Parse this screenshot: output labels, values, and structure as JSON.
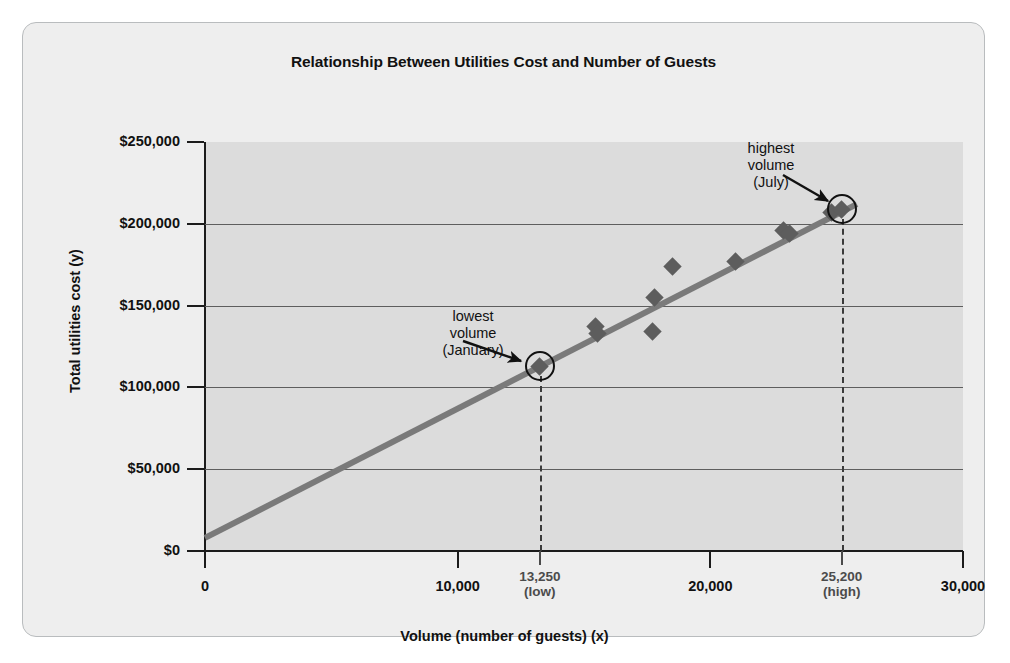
{
  "figure": {
    "title": "Relationship Between Utilities Cost and Number of Guests",
    "background_color": "#eeeeee",
    "plot_band_color": "#dcdcdc",
    "border_color": "#b9bcbe"
  },
  "chart_data": {
    "type": "scatter",
    "title": "Relationship Between Utilities Cost and Number of Guests",
    "xlabel": "Volume (number of guests) (x)",
    "ylabel": "Total utilities cost (y)",
    "xlim": [
      0,
      30000
    ],
    "ylim": [
      0,
      250000
    ],
    "grid": true,
    "legend": "none",
    "x_ticks": [
      {
        "value": 0,
        "label": "0",
        "sub": "",
        "special": false
      },
      {
        "value": 10000,
        "label": "10,000",
        "sub": "",
        "special": false
      },
      {
        "value": 13250,
        "label": "13,250",
        "sub": "(low)",
        "special": true
      },
      {
        "value": 20000,
        "label": "20,000",
        "sub": "",
        "special": false
      },
      {
        "value": 25200,
        "label": "25,200",
        "sub": "(high)",
        "special": true
      },
      {
        "value": 30000,
        "label": "30,000",
        "sub": "",
        "special": false
      }
    ],
    "y_ticks": [
      {
        "value": 0,
        "label": "$0"
      },
      {
        "value": 50000,
        "label": "$50,000"
      },
      {
        "value": 100000,
        "label": "$100,000"
      },
      {
        "value": 150000,
        "label": "$150,000"
      },
      {
        "value": 200000,
        "label": "$200,000"
      },
      {
        "value": 250000,
        "label": "$250,000"
      }
    ],
    "series": [
      {
        "name": "Monthly observations",
        "marker": "diamond",
        "color": "#5d5d5d",
        "points": [
          {
            "x": 13250,
            "y": 113000,
            "label": "January",
            "highlighted": true
          },
          {
            "x": 15450,
            "y": 137000,
            "label": "",
            "highlighted": false
          },
          {
            "x": 15550,
            "y": 133000,
            "label": "",
            "highlighted": false
          },
          {
            "x": 17700,
            "y": 134000,
            "label": "",
            "highlighted": false
          },
          {
            "x": 17800,
            "y": 155000,
            "label": "",
            "highlighted": false
          },
          {
            "x": 18500,
            "y": 174000,
            "label": "",
            "highlighted": false
          },
          {
            "x": 21000,
            "y": 177000,
            "label": "",
            "highlighted": false
          },
          {
            "x": 22900,
            "y": 196000,
            "label": "",
            "highlighted": false
          },
          {
            "x": 23150,
            "y": 194000,
            "label": "",
            "highlighted": false
          },
          {
            "x": 24800,
            "y": 207000,
            "label": "",
            "highlighted": false
          },
          {
            "x": 25200,
            "y": 209000,
            "label": "July",
            "highlighted": true
          }
        ]
      }
    ],
    "trend_line": {
      "name": "Cost estimation line",
      "color": "#7a7a7a",
      "x_start": 0,
      "y_start": 8000,
      "x_end": 25800,
      "y_end": 212000
    },
    "annotations": [
      {
        "id": "lowest-volume",
        "text_lines": [
          "lowest",
          "volume",
          "(January)"
        ],
        "points_to_x": 13250,
        "points_to_y": 113000
      },
      {
        "id": "highest-volume",
        "text_lines": [
          "highest",
          "volume",
          "(July)"
        ],
        "points_to_x": 25200,
        "points_to_y": 209000
      }
    ],
    "drop_lines": [
      {
        "x": 13250,
        "from_y": 113000,
        "to_y": 0
      },
      {
        "x": 25200,
        "from_y": 209000,
        "to_y": 0
      }
    ]
  }
}
